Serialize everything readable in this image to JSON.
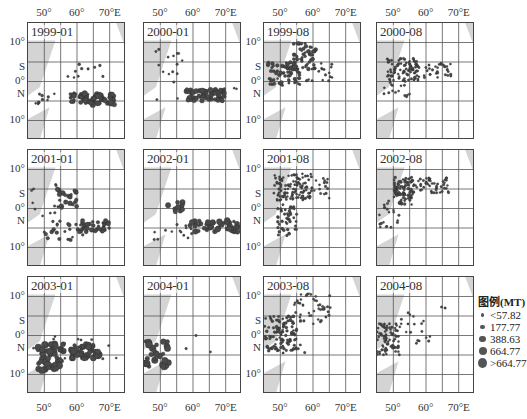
{
  "chart_data": {
    "type": "scatter",
    "title": "",
    "xlabel": "Longitude",
    "ylabel": "Latitude",
    "x_ticks": [
      "50°",
      "60°",
      "70°E"
    ],
    "y_ticks": [
      "10°",
      "S",
      "0°",
      "N",
      "10°"
    ],
    "xlim": [
      45,
      75
    ],
    "ylim": [
      -15,
      15
    ],
    "grid": true,
    "legend": {
      "title": "图例(MT)",
      "position": "right",
      "entries": [
        {
          "label": "<57.82",
          "size": 2
        },
        {
          "label": "177.77",
          "size": 3
        },
        {
          "label": "388.63",
          "size": 4
        },
        {
          "label": "664.77",
          "size": 5
        },
        {
          "label": ">664.77",
          "size": 6.5
        }
      ]
    },
    "panels": [
      {
        "label": "1999-01",
        "clusters": [
          {
            "lon": [
              58,
              72
            ],
            "lat": [
              -6,
              -3
            ],
            "n": 70,
            "sizes": [
              2,
              5
            ]
          },
          {
            "lon": [
              47,
              57
            ],
            "lat": [
              -6,
              -3
            ],
            "n": 10,
            "sizes": [
              1.5,
              2.5
            ]
          },
          {
            "lon": [
              55,
              68
            ],
            "lat": [
              1,
              5
            ],
            "n": 10,
            "sizes": [
              1.5,
              2.5
            ]
          }
        ]
      },
      {
        "label": "2000-01",
        "clusters": [
          {
            "lon": [
              58,
              70
            ],
            "lat": [
              -5,
              -2
            ],
            "n": 60,
            "sizes": [
              2.5,
              5
            ]
          },
          {
            "lon": [
              47,
              57
            ],
            "lat": [
              -5,
              10
            ],
            "n": 16,
            "sizes": [
              1.5,
              2
            ]
          },
          {
            "lon": [
              63,
              74
            ],
            "lat": [
              -3,
              -1
            ],
            "n": 6,
            "sizes": [
              1.5,
              2
            ]
          }
        ]
      },
      {
        "label": "1999-08",
        "clusters": [
          {
            "lon": [
              46,
              56
            ],
            "lat": [
              -1,
              5
            ],
            "n": 70,
            "sizes": [
              1.5,
              3.5
            ]
          },
          {
            "lon": [
              54,
              61
            ],
            "lat": [
              3,
              10
            ],
            "n": 50,
            "sizes": [
              1.5,
              3.5
            ]
          },
          {
            "lon": [
              58,
              66
            ],
            "lat": [
              0,
              5
            ],
            "n": 20,
            "sizes": [
              1.5,
              2
            ]
          }
        ]
      },
      {
        "label": "2000-08",
        "clusters": [
          {
            "lon": [
              48,
              58
            ],
            "lat": [
              0,
              6
            ],
            "n": 90,
            "sizes": [
              1.5,
              2
            ]
          },
          {
            "lon": [
              57,
              68
            ],
            "lat": [
              1,
              5
            ],
            "n": 35,
            "sizes": [
              1.5,
              2
            ]
          },
          {
            "lon": [
              47,
              55
            ],
            "lat": [
              -4,
              0
            ],
            "n": 15,
            "sizes": [
              1.5,
              2
            ]
          }
        ]
      },
      {
        "label": "2001-01",
        "clusters": [
          {
            "lon": [
              54,
              60
            ],
            "lat": [
              0,
              5
            ],
            "n": 20,
            "sizes": [
              2,
              4.5
            ]
          },
          {
            "lon": [
              60,
              70
            ],
            "lat": [
              -6,
              -3
            ],
            "n": 45,
            "sizes": [
              2,
              4
            ]
          },
          {
            "lon": [
              50,
              62
            ],
            "lat": [
              -9,
              -3
            ],
            "n": 25,
            "sizes": [
              1.5,
              3.5
            ]
          },
          {
            "lon": [
              45,
              55
            ],
            "lat": [
              -6,
              7
            ],
            "n": 12,
            "sizes": [
              1.5,
              2
            ]
          }
        ]
      },
      {
        "label": "2002-01",
        "clusters": [
          {
            "lon": [
              52,
              57
            ],
            "lat": [
              -1,
              2
            ],
            "n": 10,
            "sizes": [
              3,
              5
            ]
          },
          {
            "lon": [
              59,
              75
            ],
            "lat": [
              -6,
              -3
            ],
            "n": 50,
            "sizes": [
              2,
              5.5
            ]
          },
          {
            "lon": [
              47,
              62
            ],
            "lat": [
              -9,
              -4
            ],
            "n": 15,
            "sizes": [
              1.5,
              2
            ]
          }
        ]
      },
      {
        "label": "2001-08",
        "clusters": [
          {
            "lon": [
              48,
              60
            ],
            "lat": [
              2,
              9
            ],
            "n": 110,
            "sizes": [
              1.5,
              2
            ]
          },
          {
            "lon": [
              49,
              55
            ],
            "lat": [
              -7,
              1
            ],
            "n": 45,
            "sizes": [
              1.5,
              2.5
            ]
          },
          {
            "lon": [
              60,
              65
            ],
            "lat": [
              2,
              8
            ],
            "n": 15,
            "sizes": [
              1.5,
              2
            ]
          }
        ]
      },
      {
        "label": "2002-08",
        "clusters": [
          {
            "lon": [
              50,
              56
            ],
            "lat": [
              1,
              8
            ],
            "n": 80,
            "sizes": [
              1.5,
              2.5
            ]
          },
          {
            "lon": [
              55,
              67
            ],
            "lat": [
              4,
              8
            ],
            "n": 55,
            "sizes": [
              1.5,
              2
            ]
          },
          {
            "lon": [
              45,
              53
            ],
            "lat": [
              -5,
              2
            ],
            "n": 20,
            "sizes": [
              1.5,
              2
            ]
          }
        ]
      },
      {
        "label": "2003-01",
        "clusters": [
          {
            "lon": [
              48,
              56
            ],
            "lat": [
              -9,
              -2
            ],
            "n": 45,
            "sizes": [
              3,
              6.5
            ]
          },
          {
            "lon": [
              58,
              67
            ],
            "lat": [
              -6,
              -2
            ],
            "n": 45,
            "sizes": [
              2.5,
              6
            ]
          },
          {
            "lon": [
              46,
              73
            ],
            "lat": [
              -6,
              0
            ],
            "n": 20,
            "sizes": [
              1.5,
              2
            ]
          }
        ]
      },
      {
        "label": "2004-01",
        "clusters": [
          {
            "lon": [
              45,
              53
            ],
            "lat": [
              -8,
              -1
            ],
            "n": 28,
            "sizes": [
              3,
              6.5
            ]
          },
          {
            "lon": [
              53,
              66
            ],
            "lat": [
              -5,
              1
            ],
            "n": 3,
            "sizes": [
              1.5,
              2
            ]
          }
        ]
      },
      {
        "label": "2003-08",
        "clusters": [
          {
            "lon": [
              45,
              55
            ],
            "lat": [
              -4,
              5
            ],
            "n": 100,
            "sizes": [
              1.5,
              2.5
            ]
          },
          {
            "lon": [
              54,
              66
            ],
            "lat": [
              3,
              11
            ],
            "n": 45,
            "sizes": [
              1.5,
              2
            ]
          },
          {
            "lon": [
              50,
              60
            ],
            "lat": [
              -5,
              -1
            ],
            "n": 10,
            "sizes": [
              1.5,
              2
            ]
          }
        ]
      },
      {
        "label": "2004-08",
        "clusters": [
          {
            "lon": [
              45,
              52
            ],
            "lat": [
              -5,
              3
            ],
            "n": 80,
            "sizes": [
              1.5,
              2
            ]
          },
          {
            "lon": [
              52,
              62
            ],
            "lat": [
              -2,
              6
            ],
            "n": 18,
            "sizes": [
              1.5,
              2
            ]
          },
          {
            "lon": [
              62,
              66
            ],
            "lat": [
              7,
              9
            ],
            "n": 2,
            "sizes": [
              1.5,
              2
            ]
          }
        ]
      }
    ]
  },
  "colors": {
    "point": "#4a4a4a",
    "land": "#d4d4d4",
    "grid": "#555555",
    "border": "#444444"
  }
}
